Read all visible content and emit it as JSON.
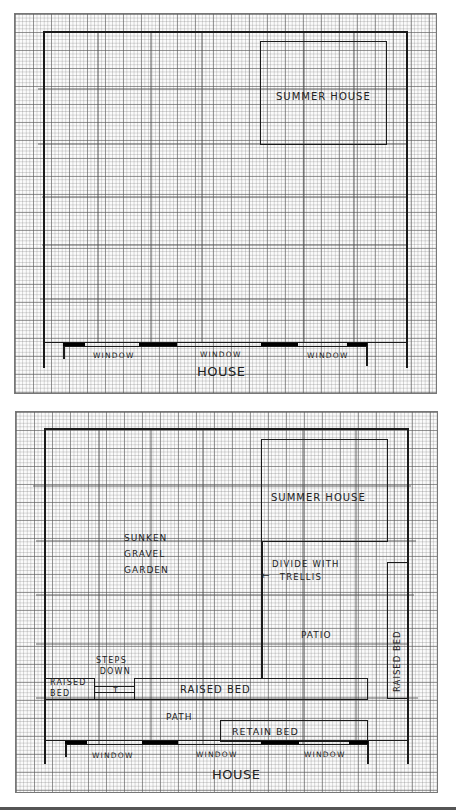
{
  "plans": [
    {
      "id": "existing",
      "labels": {
        "summer_house": "SUMMER HOUSE",
        "window_1": "WINDOW",
        "window_2": "WINDOW",
        "window_3": "WINDOW",
        "house": "HOUSE"
      }
    },
    {
      "id": "proposed",
      "labels": {
        "summer_house": "SUMMER HOUSE",
        "sunken_gravel_garden": "SUNKEN\nGRAVEL\nGARDEN",
        "divide_with_trellis": "DIVIDE WITH\n  TRELLIS",
        "trellis_arrow": "←",
        "patio": "PATIO",
        "raised_bed_right": "RAISED BED",
        "steps_down": "STEPS\n DOWN",
        "steps_arrow": "↑",
        "raised_bed_left": "RAISED\nBED",
        "raised_bed_strip": "RAISED BED",
        "path": "PATH",
        "retain_bed": "RETAIN BED",
        "window_1": "WINDOW",
        "window_2": "WINDOW",
        "window_3": "WINDOW",
        "house": "HOUSE"
      }
    }
  ],
  "colors": {
    "ink": "#1a1a1a",
    "paper": "#fbfbfb",
    "grid": "#888888"
  }
}
